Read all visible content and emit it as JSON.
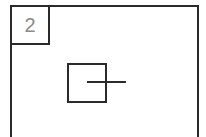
{
  "diagram": {
    "panel_number": "2",
    "elements": [
      {
        "type": "frame",
        "description": "outer rectangle"
      },
      {
        "type": "label-box",
        "text": "2"
      },
      {
        "type": "square",
        "description": "inner square"
      },
      {
        "type": "line",
        "description": "horizontal line crossing square's right edge"
      }
    ]
  }
}
